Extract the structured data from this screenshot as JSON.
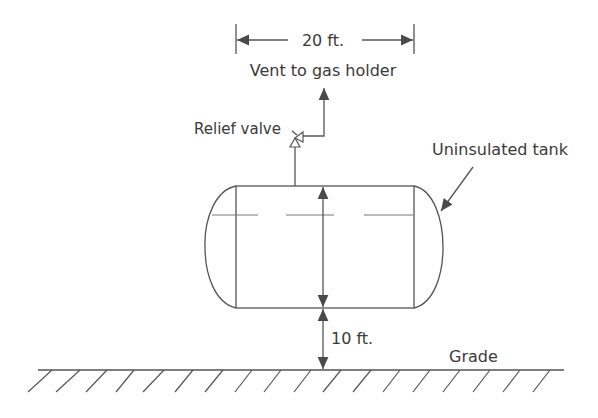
{
  "diagram": {
    "type": "process-schematic",
    "labels": {
      "width_dimension": "20 ft.",
      "vent": "Vent to gas holder",
      "relief_valve": "Relief valve",
      "tank": "Uninsulated tank",
      "elevation_dimension": "10 ft.",
      "grade": "Grade"
    },
    "components": [
      {
        "id": "tank",
        "kind": "horizontal cylindrical vessel",
        "insulated": false,
        "length": "20 ft."
      },
      {
        "id": "relief-valve",
        "kind": "relief valve on tank top"
      },
      {
        "id": "vent-line",
        "kind": "vent line to gas holder"
      },
      {
        "id": "grade",
        "kind": "ground level"
      }
    ],
    "dimensions": [
      {
        "name": "tank length",
        "value": "20 ft."
      },
      {
        "name": "tank elevation above grade",
        "value": "10 ft."
      }
    ],
    "colors": {
      "stroke": "#555555",
      "text": "#3a3a3a",
      "background": "#ffffff"
    }
  }
}
